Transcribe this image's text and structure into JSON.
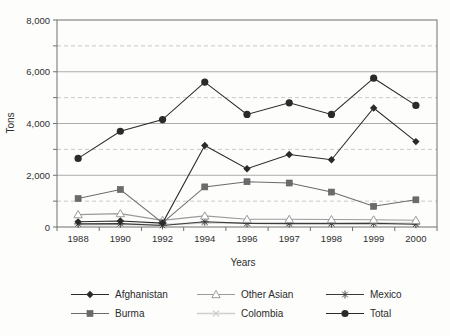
{
  "figure": {
    "background": "#fdfdfc"
  },
  "chart_data": {
    "type": "line",
    "title": "",
    "xlabel": "Years",
    "ylabel": "Tons",
    "x": [
      "1988",
      "1990",
      "1992",
      "1994",
      "1996",
      "1997",
      "1998",
      "1999",
      "2000"
    ],
    "ylim": [
      0,
      8000
    ],
    "yticks_major": [
      0,
      2000,
      4000,
      6000,
      8000
    ],
    "ytick_labels": [
      "0",
      "2,000",
      "4,000",
      "6,000",
      "8,000"
    ],
    "yticks_minor_dashed": [
      1000,
      3000,
      5000,
      7000
    ],
    "ytick_minor_step": 1000,
    "grid": "horizontal",
    "legend_position": "bottom",
    "series": [
      {
        "name": "Afghanistan",
        "marker": "diamond",
        "color": "#2a2a2a",
        "values": [
          200,
          230,
          150,
          3150,
          2250,
          2800,
          2600,
          4600,
          3300
        ]
      },
      {
        "name": "Burma",
        "marker": "square",
        "color": "#6b6b6b",
        "values": [
          1100,
          1450,
          160,
          1550,
          1750,
          1700,
          1350,
          800,
          1050
        ]
      },
      {
        "name": "Other Asian",
        "marker": "triangle-open",
        "color": "#9a9a9a",
        "values": [
          480,
          520,
          260,
          430,
          300,
          300,
          290,
          280,
          260
        ]
      },
      {
        "name": "Colombia",
        "marker": "x",
        "color": "#cfcfcf",
        "values": [
          90,
          100,
          90,
          160,
          160,
          160,
          150,
          150,
          140
        ]
      },
      {
        "name": "Mexico",
        "marker": "asterisk",
        "color": "#3a3a3a",
        "values": [
          120,
          130,
          60,
          200,
          140,
          130,
          130,
          140,
          110
        ]
      },
      {
        "name": "Total",
        "marker": "circle",
        "color": "#2a2a2a",
        "values": [
          2650,
          3700,
          4150,
          5600,
          4350,
          4800,
          4350,
          5750,
          4700
        ]
      }
    ]
  }
}
